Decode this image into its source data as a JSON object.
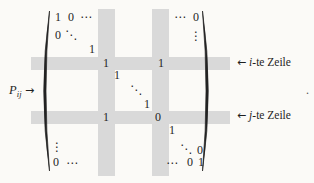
{
  "left_label": {
    "symbol": "P",
    "subscript": "ij",
    "arrow": "→"
  },
  "row_labels": [
    {
      "arrow": "←",
      "var": "i",
      "suffix": "-te Zeile"
    },
    {
      "arrow": "←",
      "var": "j",
      "suffix": "-te Zeile"
    }
  ],
  "trailing_punctuation": ".",
  "colors": {
    "band": "#d9d9d9",
    "background": "#fbfaf7",
    "ink": "#1f1f1f"
  },
  "matrix": {
    "entries": [
      {
        "t": "1"
      },
      {
        "t": "0"
      },
      {
        "t": "⋯"
      },
      {
        "t": "⋯"
      },
      {
        "t": "0"
      },
      {
        "t": "0"
      },
      {
        "t": "⋱"
      },
      {
        "t": "⋮"
      },
      {
        "t": "1"
      },
      {
        "t": "1"
      },
      {
        "t": "1"
      },
      {
        "t": "1"
      },
      {
        "t": "⋱"
      },
      {
        "t": "1"
      },
      {
        "t": "1"
      },
      {
        "t": "0"
      },
      {
        "t": "1"
      },
      {
        "t": "⋮"
      },
      {
        "t": "⋱"
      },
      {
        "t": "0"
      },
      {
        "t": "0"
      },
      {
        "t": "⋯"
      },
      {
        "t": "⋯"
      },
      {
        "t": "0"
      },
      {
        "t": "1"
      }
    ]
  }
}
